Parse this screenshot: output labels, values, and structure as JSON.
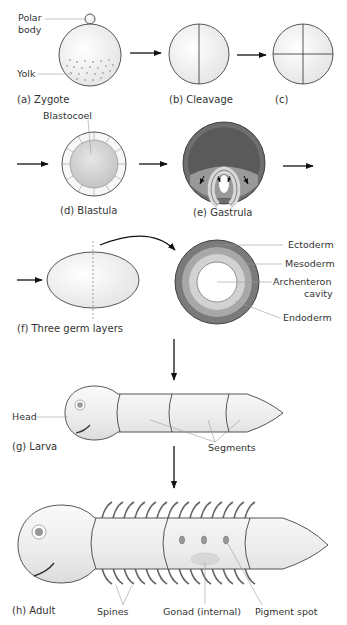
{
  "colors": {
    "outline": "#444444",
    "cell_fill": "#f2f2f2",
    "ectoderm": "#7a7a7a",
    "mesoderm": "#a8a8a8",
    "endoderm": "#d2d2d2",
    "cavity": "#ffffff",
    "leader_line": "#9a9a9a",
    "arrow": "#111111"
  },
  "stages": {
    "a": {
      "caption": "(a)  Zygote",
      "labels": {
        "polar_body_1": "Polar",
        "polar_body_2": "body",
        "yolk": "Yolk"
      }
    },
    "b": {
      "caption": "(b)  Cleavage"
    },
    "c": {
      "caption": "(c)"
    },
    "d": {
      "caption": "(d)  Blastula",
      "labels": {
        "blastocoel": "Blastocoel"
      }
    },
    "e": {
      "caption": "(e)  Gastrula"
    },
    "f": {
      "caption": "(f)  Three germ layers",
      "labels": {
        "ectoderm": "Ectoderm",
        "mesoderm": "Mesoderm",
        "archenteron_1": "Archenteron",
        "archenteron_2": "cavity",
        "endoderm": "Endoderm"
      }
    },
    "g": {
      "caption": "(g)  Larva",
      "labels": {
        "head": "Head",
        "segments": "Segments"
      }
    },
    "h": {
      "caption": "(h)  Adult",
      "labels": {
        "spines": "Spines",
        "gonad": "Gonad (internal)",
        "pigment_spot": "Pigment spot"
      }
    }
  }
}
